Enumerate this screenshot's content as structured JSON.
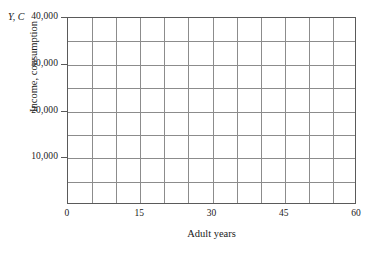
{
  "chart_data": {
    "type": "table",
    "title": "",
    "subtitle": "",
    "xlabel": "Adult years",
    "ylabel": "Income, consumption",
    "y_axis_symbol": "Y, C",
    "xlim": [
      0,
      60
    ],
    "ylim": [
      0,
      40000
    ],
    "x_major_ticks": [
      0,
      15,
      30,
      45,
      60
    ],
    "x_major_tick_labels": [
      "0",
      "15",
      "30",
      "45",
      "60"
    ],
    "x_gridline_values": [
      0,
      5,
      10,
      15,
      20,
      25,
      30,
      35,
      40,
      45,
      50,
      55,
      60
    ],
    "x_gridline_step": 5,
    "x_grid_columns": 12,
    "y_major_ticks": [
      10000,
      20000,
      30000,
      40000
    ],
    "y_major_tick_labels": [
      "10,000",
      "20,000",
      "30,000",
      "40,000"
    ],
    "y_gridline_values": [
      0,
      5000,
      10000,
      15000,
      20000,
      25000,
      30000,
      35000,
      40000
    ],
    "y_gridline_step": 5000,
    "y_grid_rows": 8,
    "grid": true,
    "legend": false,
    "legend_entries": [],
    "series": [],
    "values": [],
    "categories": [],
    "annotations": [],
    "colors": {
      "background": "#ffffff",
      "gridline": "#8c8c8c",
      "axis": "#5a5a5a",
      "text": "#1a1a1a"
    }
  }
}
